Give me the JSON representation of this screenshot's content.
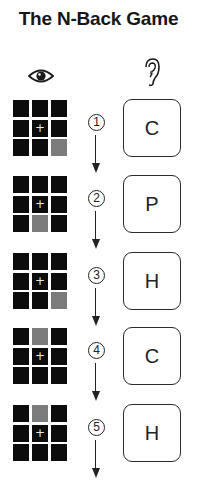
{
  "title": "The N-Back Game",
  "headers": {
    "visual_icon": "eye-icon",
    "audio_icon": "ear-icon"
  },
  "colors": {
    "cell": "#0c0c0c",
    "lit_cell": "#7b7b7b",
    "background": "#ffffff"
  },
  "steps": [
    {
      "number": "1",
      "circled": "①",
      "letter": "C",
      "lit_position": {
        "row": 3,
        "col": 3
      }
    },
    {
      "number": "2",
      "circled": "②",
      "letter": "P",
      "lit_position": {
        "row": 3,
        "col": 2
      }
    },
    {
      "number": "3",
      "circled": "③",
      "letter": "H",
      "lit_position": {
        "row": 3,
        "col": 3
      }
    },
    {
      "number": "4",
      "circled": "④",
      "letter": "C",
      "lit_position": {
        "row": 1,
        "col": 2
      }
    },
    {
      "number": "5",
      "circled": "⑤",
      "letter": "H",
      "lit_position": {
        "row": 1,
        "col": 2
      }
    }
  ],
  "grid_center_symbol": "+"
}
